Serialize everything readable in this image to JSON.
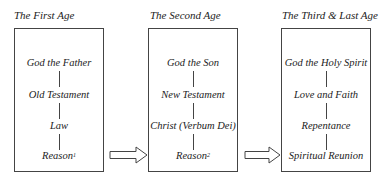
{
  "ages": [
    {
      "title": "The First Age",
      "items": [
        "God the Father",
        "Old Testament",
        "Law",
        "Reason"
      ],
      "footnote": "1"
    },
    {
      "title": "The Second Age",
      "items": [
        "God the Son",
        "New Testament",
        "Christ (Verbum Dei)",
        "Reason"
      ],
      "footnote": "2"
    },
    {
      "title": "The Third & Last Age",
      "items": [
        "God the Holy Spirit",
        "Love and Faith",
        "Repentance",
        "Spiritual Reunion"
      ]
    }
  ],
  "arrows": [
    {
      "from": "The First Age",
      "to": "The Second Age"
    },
    {
      "from": "The Second Age",
      "to": "The Third & Last Age"
    }
  ],
  "colors": {
    "line": "#444444",
    "text": "#222222",
    "background": "#ffffff"
  }
}
